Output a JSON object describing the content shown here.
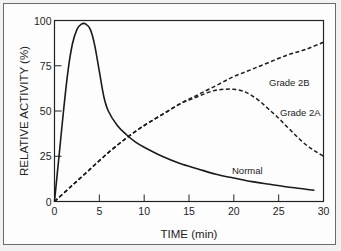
{
  "chart_data": {
    "type": "line",
    "title": "",
    "xlabel": "TIME (min)",
    "ylabel": "RELATIVE ACTIVITY (%)",
    "xlim": [
      0,
      30
    ],
    "ylim": [
      0,
      100
    ],
    "x_ticks": [
      0,
      5,
      10,
      15,
      20,
      25,
      30
    ],
    "y_ticks": [
      0,
      25,
      50,
      75,
      100
    ],
    "grid": false,
    "legend": "inline labels",
    "series": [
      {
        "name": "Normal",
        "style": "solid",
        "x": [
          0,
          0.5,
          1,
          1.5,
          2,
          2.5,
          3,
          3.5,
          4,
          4.5,
          5,
          5.5,
          6,
          7,
          8,
          9,
          10,
          12,
          14,
          16,
          18,
          20,
          22,
          24,
          26,
          28,
          29
        ],
        "y": [
          0,
          25,
          50,
          72,
          87,
          95,
          98,
          98,
          95,
          86,
          72,
          58,
          50,
          42,
          37,
          33,
          30,
          25,
          21,
          18,
          15,
          13,
          11,
          9.5,
          8,
          6.8,
          6.2
        ]
      },
      {
        "name": "Grade 2B",
        "style": "dashed",
        "x": [
          0,
          2,
          4,
          6,
          8,
          10,
          12,
          14,
          16,
          18,
          20,
          22,
          24,
          26,
          28,
          30
        ],
        "y": [
          0,
          9,
          18,
          27,
          35,
          42,
          48,
          54,
          59,
          64,
          69,
          73,
          77,
          81,
          84,
          88
        ]
      },
      {
        "name": "Grade 2A",
        "style": "dashed",
        "x": [
          0,
          2,
          4,
          6,
          8,
          10,
          12,
          14,
          15,
          16,
          17,
          18,
          19,
          20,
          21,
          22,
          23,
          24,
          25,
          26,
          27,
          28,
          29,
          30
        ],
        "y": [
          0,
          9,
          18,
          27,
          35,
          42,
          48,
          54,
          56,
          58,
          60,
          61.5,
          62,
          62,
          61,
          58.5,
          55,
          50.5,
          46,
          41,
          36,
          31.5,
          28,
          25
        ]
      }
    ],
    "annotations": [
      {
        "text": "Grade 2B",
        "x": 24.5,
        "y": 74
      },
      {
        "text": "Grade 2A",
        "x": 25.5,
        "y": 49
      },
      {
        "text": "Normal",
        "x": 20.5,
        "y": 16
      }
    ]
  },
  "labels": {
    "x_title": "TIME (min)",
    "y_title": "RELATIVE ACTIVITY (%)",
    "x_ticks": [
      "0",
      "5",
      "10",
      "15",
      "20",
      "25",
      "30"
    ],
    "y_ticks": [
      "0",
      "25",
      "50",
      "75",
      "100"
    ],
    "normal": "Normal",
    "grade2a": "Grade 2A",
    "grade2b": "Grade 2B"
  }
}
